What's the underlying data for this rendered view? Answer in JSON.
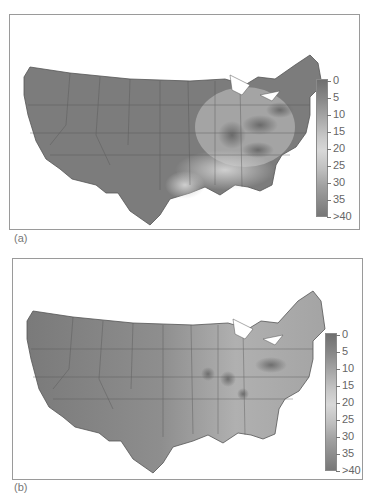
{
  "panels": [
    {
      "id": "a",
      "caption": "(a)",
      "legend": {
        "ticks": [
          "0",
          "5",
          "10",
          "15",
          "20",
          "25",
          "30",
          "35",
          ">40"
        ],
        "gradient_colors": [
          "#6f6f6f",
          "#8a8a8a",
          "#a8a8a8",
          "#c8c8c8",
          "#d8d8d8",
          "#c0c0c0",
          "#a0a0a0",
          "#8a8a8a",
          "#777777"
        ]
      },
      "description": "Contiguous US shaded map; darker bands over Ohio Valley, Pennsylvania, New York and Tennessee; lighter values across Southeast"
    },
    {
      "id": "b",
      "caption": "(b)",
      "legend": {
        "ticks": [
          "0",
          "5",
          "10",
          "15",
          "20",
          "25",
          "30",
          "35",
          ">40"
        ],
        "gradient_colors": [
          "#6f6f6f",
          "#8a8a8a",
          "#a8a8a8",
          "#c8c8c8",
          "#d8d8d8",
          "#c0c0c0",
          "#a0a0a0",
          "#8a8a8a",
          "#777777"
        ]
      },
      "description": "Contiguous US shaded map; smoother gradient with darker West and lighter East, localized dark spots in Pennsylvania, Ohio, Missouri and Tennessee"
    }
  ]
}
